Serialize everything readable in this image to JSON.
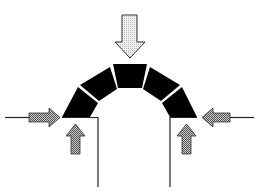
{
  "diagram": {
    "type": "structural-arch-forces",
    "colors": {
      "background": "#ffffff",
      "arch_block": "#000000",
      "joint": "#ffffff",
      "line": "#222222",
      "load_arrow_fill": "#e4e4e4",
      "thrust_arrow_fill": "#9a9a9a",
      "arrow_stroke": "#333333"
    },
    "elements": {
      "arch": {
        "voussoirs": 5,
        "label": "arch"
      },
      "load_arrow": {
        "direction": "down",
        "label": "vertical load"
      },
      "left_thrust_arrow": {
        "direction": "right",
        "label": "horizontal thrust left"
      },
      "right_thrust_arrow": {
        "direction": "left",
        "label": "horizontal thrust right"
      },
      "left_reaction_arrow": {
        "direction": "up",
        "label": "vertical reaction left"
      },
      "right_reaction_arrow": {
        "direction": "up",
        "label": "vertical reaction right"
      },
      "left_pier": {
        "label": "left support"
      },
      "right_pier": {
        "label": "right support"
      }
    }
  }
}
